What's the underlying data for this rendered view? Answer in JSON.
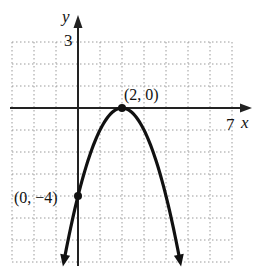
{
  "chart_data": {
    "type": "line",
    "title": "",
    "function": "y = -(x - 2)^2",
    "xlabel": "x",
    "ylabel": "y",
    "xlim": [
      -3,
      7
    ],
    "ylim": [
      -7,
      3
    ],
    "grid": true,
    "x_tick_labels": [
      "7"
    ],
    "y_tick_labels": [
      "3"
    ],
    "points": [
      {
        "x": 2,
        "y": 0,
        "label": "(2, 0)"
      },
      {
        "x": 0,
        "y": -4,
        "label": "(0, −4)"
      }
    ],
    "series": [
      {
        "name": "parabola",
        "x": [
          -0.6,
          0,
          1,
          2,
          3,
          4,
          4.6
        ],
        "y": [
          -6.76,
          -4,
          -1,
          0,
          -1,
          -4,
          -6.76
        ]
      }
    ],
    "annotations": [
      "(2, 0)",
      "(0, −4)"
    ]
  },
  "labels": {
    "x_axis": "x",
    "y_axis": "y",
    "x_max_tick": "7",
    "y_max_tick": "3",
    "vertex": "(2, 0)",
    "y_intercept": "(0, −4)"
  },
  "colors": {
    "curve": "#111111",
    "axis": "#222222",
    "grid": "#9a9a9a"
  }
}
